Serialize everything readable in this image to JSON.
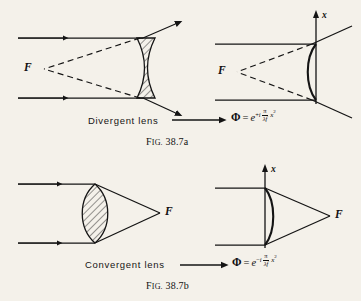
{
  "page": {
    "background_color": "#f4f1ea",
    "ink_color": "#111111"
  },
  "panels": [
    {
      "id": "divergent-ray-diagram",
      "position": "top-left",
      "lens_type": "biconcave",
      "hatched": true,
      "focal_label": "F",
      "focal_side": "left",
      "rays": "two parallel horizontal rays entering from left, diverging after lens, dashed back-projections meeting at virtual focus F"
    },
    {
      "id": "divergent-phase-diagram",
      "position": "top-right",
      "lens_type": "single-curved-surface",
      "hatched": false,
      "focal_label": "F",
      "axis_label": "x",
      "axis_direction": "up",
      "rays": "two parallel horizontal rays, diverging after curved surface, dashed back-projections meeting at virtual focus F"
    },
    {
      "id": "convergent-ray-diagram",
      "position": "bottom-left",
      "lens_type": "biconvex",
      "hatched": true,
      "focal_label": "F",
      "focal_side": "right",
      "rays": "two parallel horizontal rays converging to real focus F at right"
    },
    {
      "id": "convergent-phase-diagram",
      "position": "bottom-right",
      "lens_type": "single-curved-surface",
      "hatched": false,
      "focal_label": "F",
      "axis_label": "x",
      "axis_direction": "up",
      "rays": "two parallel horizontal rays converging to real focus F at right"
    }
  ],
  "rows": {
    "divergent": {
      "lens_label": "Divergent lens",
      "arrow": "→",
      "formula": {
        "lhs": "Φ",
        "equals": "=",
        "base": "e",
        "exponent_sign": "+",
        "imaginary_unit": "i",
        "numerator": "π",
        "denominator": "λf",
        "variable": "x",
        "power": "2",
        "plain": "Φ = e^{+i π/λf x²}"
      },
      "caption_small_caps": "F",
      "caption_rest": "IG.",
      "caption_number": "38.7a",
      "caption_plain": "FIG. 38.7a"
    },
    "convergent": {
      "lens_label": "Convergent lens",
      "arrow": "→",
      "formula": {
        "lhs": "Φ",
        "equals": "=",
        "base": "e",
        "exponent_sign": "−",
        "imaginary_unit": "i",
        "numerator": "π",
        "denominator": "λf",
        "variable": "x",
        "power": "2",
        "plain": "Φ = e^{-i π/λf x²}"
      },
      "caption_small_caps": "F",
      "caption_rest": "IG.",
      "caption_number": "38.7b",
      "caption_plain": "FIG. 38.7b"
    }
  },
  "symbols": {
    "focus": "F",
    "axis": "x"
  }
}
